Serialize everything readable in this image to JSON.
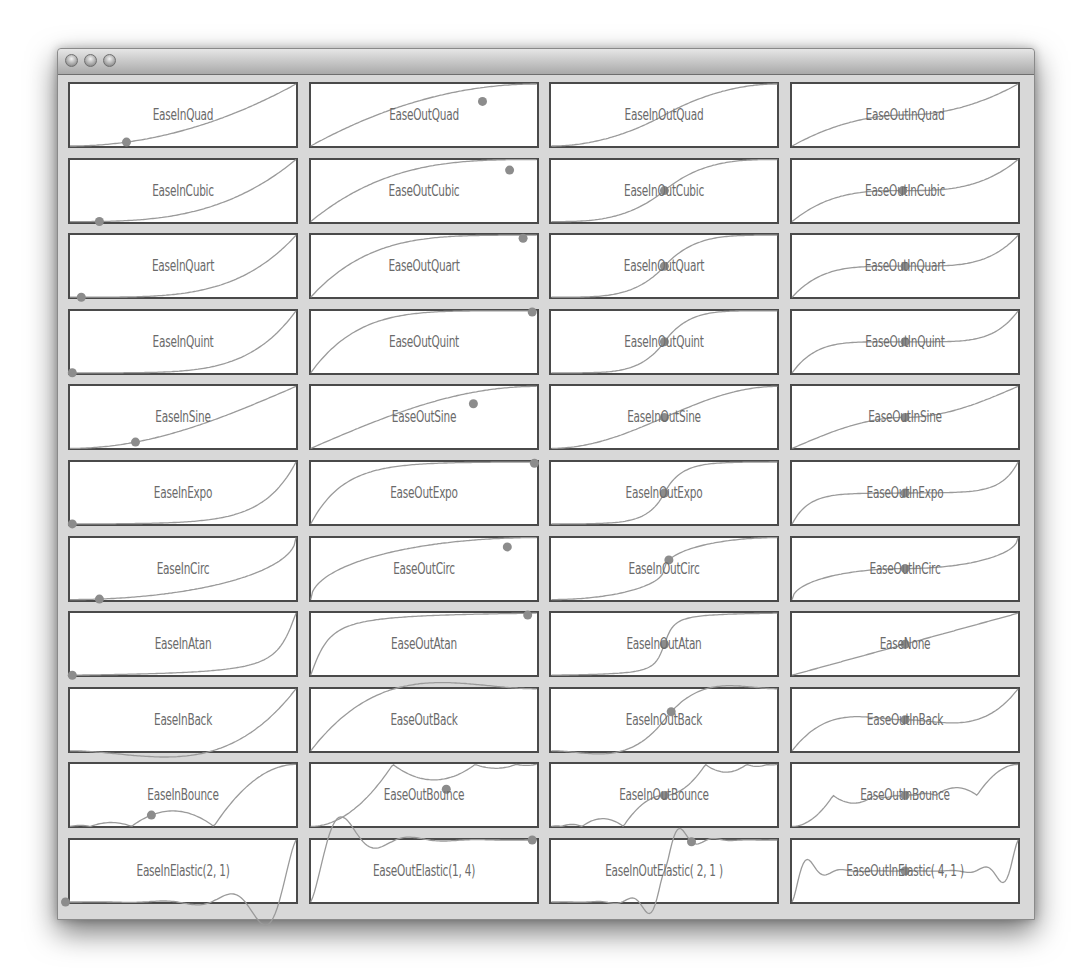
{
  "window": {
    "title_buttons": [
      "close-button",
      "minimize-button",
      "zoom-button"
    ]
  },
  "style": {
    "panel_border": "#4a4a4a",
    "curve_color": "#9a9a9a",
    "dot_color": "#8c8c8c",
    "label_color": "#6a6a6a",
    "background": "#d8d8d8"
  },
  "grid": {
    "columns": 4,
    "rows": 11,
    "panels": [
      {
        "label": "EaseInQuad",
        "fn": "inQuad",
        "dot": [
          0.25,
          0.2
        ]
      },
      {
        "label": "EaseOutQuad",
        "fn": "outQuad",
        "dot": [
          0.76,
          0.72
        ]
      },
      {
        "label": "EaseInOutQuad",
        "fn": "inOutQuad",
        "dot": null
      },
      {
        "label": "EaseOutInQuad",
        "fn": "outInQuad",
        "dot": null
      },
      {
        "label": "EaseInCubic",
        "fn": "inCubic",
        "dot": [
          0.13,
          0.07
        ]
      },
      {
        "label": "EaseOutCubic",
        "fn": "outCubic",
        "dot": [
          0.88,
          0.83
        ]
      },
      {
        "label": "EaseInOutCubic",
        "fn": "inOutCubic",
        "dot": [
          0.5,
          0.5
        ]
      },
      {
        "label": "EaseOutInCubic",
        "fn": "outInCubic",
        "dot": [
          0.49,
          0.5
        ]
      },
      {
        "label": "EaseInQuart",
        "fn": "inQuart",
        "dot": [
          0.05,
          0.02
        ]
      },
      {
        "label": "EaseOutQuart",
        "fn": "outQuart",
        "dot": [
          0.94,
          0.95
        ]
      },
      {
        "label": "EaseInOutQuart",
        "fn": "inOutQuart",
        "dot": [
          0.5,
          0.5
        ]
      },
      {
        "label": "EaseOutInQuart",
        "fn": "outInQuart",
        "dot": [
          0.5,
          0.5
        ]
      },
      {
        "label": "EaseInQuint",
        "fn": "inQuint",
        "dot": [
          0.01,
          0.0
        ]
      },
      {
        "label": "EaseOutQuint",
        "fn": "outQuint",
        "dot": [
          0.98,
          0.98
        ]
      },
      {
        "label": "EaseInOutQuint",
        "fn": "inOutQuint",
        "dot": [
          0.5,
          0.5
        ]
      },
      {
        "label": "EaseOutInQuint",
        "fn": "outInQuint",
        "dot": [
          0.5,
          0.5
        ]
      },
      {
        "label": "EaseInSine",
        "fn": "inSine",
        "dot": [
          0.29,
          0.27
        ]
      },
      {
        "label": "EaseOutSine",
        "fn": "outSine",
        "dot": [
          0.72,
          0.72
        ]
      },
      {
        "label": "EaseInOutSine",
        "fn": "inOutSine",
        "dot": [
          0.5,
          0.5
        ]
      },
      {
        "label": "EaseOutInSine",
        "fn": "outInSine",
        "dot": [
          0.5,
          0.5
        ]
      },
      {
        "label": "EaseInExpo",
        "fn": "inExpo",
        "dot": [
          0.01,
          0.0
        ]
      },
      {
        "label": "EaseOutExpo",
        "fn": "outExpo",
        "dot": [
          0.99,
          0.98
        ]
      },
      {
        "label": "EaseInOutExpo",
        "fn": "inOutExpo",
        "dot": [
          0.5,
          0.6
        ]
      },
      {
        "label": "EaseOutInExpo",
        "fn": "outInExpo",
        "dot": [
          0.5,
          0.5
        ]
      },
      {
        "label": "EaseInCirc",
        "fn": "inCirc",
        "dot": [
          0.13,
          0.1
        ]
      },
      {
        "label": "EaseOutCirc",
        "fn": "outCirc",
        "dot": [
          0.87,
          0.85
        ]
      },
      {
        "label": "EaseInOutCirc",
        "fn": "inOutCirc",
        "dot": [
          0.52,
          0.62
        ]
      },
      {
        "label": "EaseOutInCirc",
        "fn": "outInCirc",
        "dot": [
          0.5,
          0.5
        ]
      },
      {
        "label": "EaseInAtan",
        "fn": "inAtan",
        "dot": [
          0.01,
          0.0
        ]
      },
      {
        "label": "EaseOutAtan",
        "fn": "outAtan",
        "dot": [
          0.96,
          0.97
        ]
      },
      {
        "label": "EaseInOutAtan",
        "fn": "inOutAtan",
        "dot": [
          0.5,
          0.55
        ]
      },
      {
        "label": "EaseNone",
        "fn": "none",
        "dot": [
          0.5,
          0.5
        ]
      },
      {
        "label": "EaseInBack",
        "fn": "inBack",
        "dot": null
      },
      {
        "label": "EaseOutBack",
        "fn": "outBack",
        "dot": null
      },
      {
        "label": "EaseInOutBack",
        "fn": "inOutBack",
        "dot": [
          0.53,
          0.55
        ]
      },
      {
        "label": "EaseOutInBack",
        "fn": "outInBack",
        "dot": [
          0.5,
          0.5
        ]
      },
      {
        "label": "EaseInBounce",
        "fn": "inBounce",
        "dot": [
          0.36,
          0.35
        ]
      },
      {
        "label": "EaseOutBounce",
        "fn": "outBounce",
        "dot": [
          0.6,
          0.6
        ]
      },
      {
        "label": "EaseInOutBounce",
        "fn": "inOutBounce",
        "dot": [
          0.5,
          0.5
        ]
      },
      {
        "label": "EaseOutInBounce",
        "fn": "outInBounce",
        "dot": [
          0.5,
          0.5
        ]
      },
      {
        "label": "EaseInElastic(2, 1)",
        "fn": "inElastic",
        "dot": [
          -0.02,
          -0.1
        ]
      },
      {
        "label": "EaseOutElastic(1, 4)",
        "fn": "outElastic",
        "dot": [
          0.98,
          1.0
        ]
      },
      {
        "label": "EaseInOutElastic( 2, 1 )",
        "fn": "inOutElastic",
        "dot": [
          0.62,
          0.78
        ]
      },
      {
        "label": "EaseOutInElastic( 4, 1 )",
        "fn": "outInElastic",
        "dot": [
          0.5,
          0.5
        ]
      }
    ]
  }
}
